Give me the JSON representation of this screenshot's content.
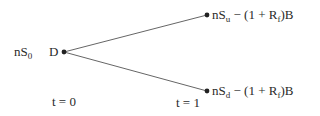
{
  "diagram": {
    "type": "binomial-tree",
    "root": {
      "left_label": {
        "base": "nS",
        "sub": "0"
      },
      "node_label": "D"
    },
    "up_node": {
      "label_prefix": "nS",
      "label_sub": "u",
      "label_suffix_a": " − (1 + R",
      "label_suffix_sub": "f",
      "label_suffix_b": ")B"
    },
    "down_node": {
      "label_prefix": "nS",
      "label_sub": "d",
      "label_suffix_a": " − (1 + R",
      "label_suffix_sub": "f",
      "label_suffix_b": ")B"
    },
    "time_labels": {
      "t0": "t = 0",
      "t1": "t = 1"
    },
    "colors": {
      "line": "#555555",
      "dot": "#222222",
      "text": "#2a2a2a"
    }
  }
}
